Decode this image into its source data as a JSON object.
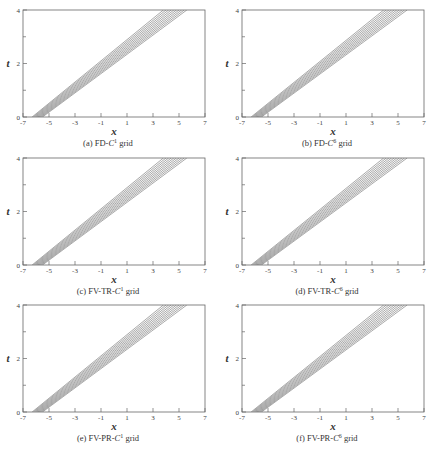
{
  "chart_data": [
    {
      "type": "line",
      "id": "a",
      "title": "",
      "caption": {
        "prefix": "(a) FD-",
        "var": "C",
        "sup": "1",
        "suffix": " grid"
      },
      "xlabel": "x",
      "ylabel": "t",
      "xlim": [
        -7,
        7
      ],
      "ylim": [
        0,
        4
      ],
      "xticks": [
        -7,
        -5,
        -3,
        -1,
        1,
        3,
        5,
        7
      ],
      "yticks": [
        0,
        2,
        4
      ],
      "yminor": [
        1,
        3
      ],
      "grid": false,
      "contour_band": {
        "n_lines": 10,
        "x_at_t0": [
          -6.3,
          -5.5
        ],
        "x_at_t4": [
          3.8,
          5.6
        ]
      }
    },
    {
      "type": "line",
      "id": "b",
      "title": "",
      "caption": {
        "prefix": "(b) FD-",
        "var": "C",
        "sup": "6",
        "suffix": " grid"
      },
      "xlabel": "x",
      "ylabel": "t",
      "xlim": [
        -7,
        7
      ],
      "ylim": [
        0,
        4
      ],
      "xticks": [
        -7,
        -5,
        -3,
        -1,
        1,
        3,
        5,
        7
      ],
      "yticks": [
        0,
        2,
        4
      ],
      "yminor": [
        1,
        3
      ],
      "grid": false,
      "contour_band": {
        "n_lines": 10,
        "x_at_t0": [
          -6.3,
          -5.5
        ],
        "x_at_t4": [
          3.9,
          5.7
        ]
      }
    },
    {
      "type": "line",
      "id": "c",
      "title": "",
      "caption": {
        "prefix": "(c) FV-TR-",
        "var": "C",
        "sup": "1",
        "suffix": " grid"
      },
      "xlabel": "x",
      "ylabel": "t",
      "xlim": [
        -7,
        7
      ],
      "ylim": [
        0,
        4
      ],
      "xticks": [
        -7,
        -5,
        -3,
        -1,
        1,
        3,
        5,
        7
      ],
      "yticks": [
        0,
        2,
        4
      ],
      "yminor": [
        1,
        3
      ],
      "grid": false,
      "contour_band": {
        "n_lines": 10,
        "x_at_t0": [
          -6.3,
          -5.5
        ],
        "x_at_t4": [
          3.8,
          5.6
        ]
      }
    },
    {
      "type": "line",
      "id": "d",
      "title": "",
      "caption": {
        "prefix": "(d) FV-TR-",
        "var": "C",
        "sup": "6",
        "suffix": " grid"
      },
      "xlabel": "x",
      "ylabel": "t",
      "xlim": [
        -7,
        7
      ],
      "ylim": [
        0,
        4
      ],
      "xticks": [
        -7,
        -5,
        -3,
        -1,
        1,
        3,
        5,
        7
      ],
      "yticks": [
        0,
        2,
        4
      ],
      "yminor": [
        1,
        3
      ],
      "grid": false,
      "contour_band": {
        "n_lines": 10,
        "x_at_t0": [
          -6.3,
          -5.5
        ],
        "x_at_t4": [
          3.9,
          5.7
        ]
      }
    },
    {
      "type": "line",
      "id": "e",
      "title": "",
      "caption": {
        "prefix": "(e) FV-PR-",
        "var": "C",
        "sup": "1",
        "suffix": " grid"
      },
      "xlabel": "x",
      "ylabel": "t",
      "xlim": [
        -7,
        7
      ],
      "ylim": [
        0,
        4
      ],
      "xticks": [
        -7,
        -5,
        -3,
        -1,
        1,
        3,
        5,
        7
      ],
      "yticks": [
        0,
        2,
        4
      ],
      "yminor": [
        1,
        3
      ],
      "grid": false,
      "contour_band": {
        "n_lines": 10,
        "x_at_t0": [
          -6.3,
          -5.5
        ],
        "x_at_t4": [
          3.8,
          5.6
        ]
      }
    },
    {
      "type": "line",
      "id": "f",
      "title": "",
      "caption": {
        "prefix": "(f) FV-PR-",
        "var": "C",
        "sup": "6",
        "suffix": " grid"
      },
      "xlabel": "x",
      "ylabel": "t",
      "xlim": [
        -7,
        7
      ],
      "ylim": [
        0,
        4
      ],
      "xticks": [
        -7,
        -5,
        -3,
        -1,
        1,
        3,
        5,
        7
      ],
      "yticks": [
        0,
        2,
        4
      ],
      "yminor": [
        1,
        3
      ],
      "grid": false,
      "contour_band": {
        "n_lines": 10,
        "x_at_t0": [
          -6.3,
          -5.5
        ],
        "x_at_t4": [
          3.9,
          5.7
        ]
      }
    }
  ]
}
